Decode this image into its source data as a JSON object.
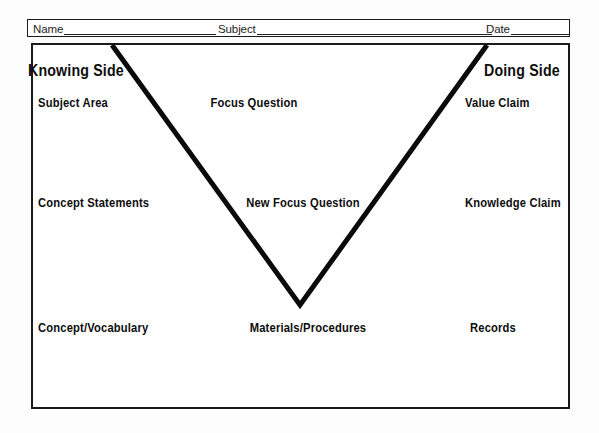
{
  "page": {
    "background_color": "#fdfdfd",
    "ink_color": "#0d0d0d"
  },
  "header": {
    "fields": [
      {
        "label": "Name",
        "value": ""
      },
      {
        "label": "Subject",
        "value": ""
      },
      {
        "label": "Date",
        "value": ""
      }
    ]
  },
  "diagram": {
    "headings": {
      "left": "Knowing Side",
      "right": "Doing Side"
    },
    "rows": [
      {
        "left": "Subject Area",
        "center": "Focus Question",
        "right": "Value Claim"
      },
      {
        "left": "Concept Statements",
        "center": "New Focus Question",
        "right": "Knowledge Claim"
      },
      {
        "left": "Concept/Vocabulary",
        "center": "Materials/Procedures",
        "right": "Records"
      }
    ],
    "vee": {
      "stroke_color": "#0a0a0a",
      "stroke_width": 5,
      "left_top": [
        81,
        2
      ],
      "vertex": [
        269,
        262
      ],
      "right_top": [
        456,
        2
      ]
    }
  }
}
